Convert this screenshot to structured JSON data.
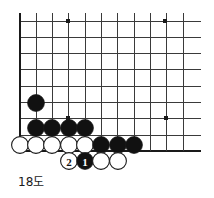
{
  "figure": {
    "caption": "18도",
    "kind": "go-board-diagram",
    "board": {
      "edges": {
        "left": true,
        "bottom": true,
        "top": false,
        "right": false
      },
      "origin_x": 20,
      "origin_y": 21,
      "spacing": 16.3,
      "cols": 11,
      "rows": 9,
      "line_color": "#3a3a3a",
      "edge_color": "#1a1a1a",
      "background": "#ffffff"
    },
    "star_points": [
      {
        "x": 68,
        "y": 21
      },
      {
        "x": 165,
        "y": 21
      },
      {
        "x": 68,
        "y": 118
      },
      {
        "x": 166,
        "y": 118
      }
    ],
    "colors": {
      "black_stone": "#111111",
      "white_stone": "#ffffff",
      "stone_outline": "#1a1a1a",
      "black_label": "#ffffff",
      "white_label": "#111111"
    },
    "stone_radius": 8.4,
    "stones": [
      {
        "id": "b-a",
        "color": "black",
        "x": 36,
        "y": 103,
        "label": ""
      },
      {
        "id": "b-b",
        "color": "black",
        "x": 36,
        "y": 128,
        "label": ""
      },
      {
        "id": "b-c",
        "color": "black",
        "x": 52,
        "y": 128,
        "label": ""
      },
      {
        "id": "b-d",
        "color": "black",
        "x": 69,
        "y": 128,
        "label": ""
      },
      {
        "id": "b-e",
        "color": "black",
        "x": 85,
        "y": 128,
        "label": ""
      },
      {
        "id": "w-a",
        "color": "white",
        "x": 20,
        "y": 145,
        "label": ""
      },
      {
        "id": "w-b",
        "color": "white",
        "x": 36,
        "y": 145,
        "label": ""
      },
      {
        "id": "w-c",
        "color": "white",
        "x": 52,
        "y": 145,
        "label": ""
      },
      {
        "id": "w-d",
        "color": "white",
        "x": 69,
        "y": 145,
        "label": ""
      },
      {
        "id": "w-e",
        "color": "white",
        "x": 85,
        "y": 145,
        "label": ""
      },
      {
        "id": "b-f",
        "color": "black",
        "x": 101,
        "y": 145,
        "label": ""
      },
      {
        "id": "b-g",
        "color": "black",
        "x": 118,
        "y": 145,
        "label": ""
      },
      {
        "id": "b-h",
        "color": "black",
        "x": 134,
        "y": 145,
        "label": ""
      },
      {
        "id": "w-move-2",
        "color": "white",
        "x": 69,
        "y": 161,
        "label": "2"
      },
      {
        "id": "b-move-1",
        "color": "black",
        "x": 85,
        "y": 161,
        "label": "1"
      },
      {
        "id": "w-f",
        "color": "white",
        "x": 101,
        "y": 161,
        "label": ""
      },
      {
        "id": "w-g",
        "color": "white",
        "x": 118,
        "y": 161,
        "label": ""
      }
    ],
    "move_numbers": [
      {
        "number": "1",
        "color": "black"
      },
      {
        "number": "2",
        "color": "white"
      }
    ]
  }
}
